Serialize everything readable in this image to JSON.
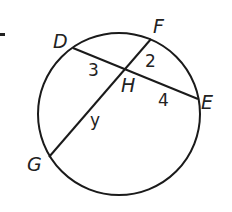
{
  "diagram": {
    "type": "circle-intersecting-chords",
    "marker": "-",
    "circle": {
      "cx": 119,
      "cy": 114,
      "r": 81,
      "stroke": "#1a1a1a"
    },
    "points": {
      "D": {
        "label": "D",
        "x": 73,
        "y": 48
      },
      "F": {
        "label": "F",
        "x": 151,
        "y": 39
      },
      "H": {
        "label": "H",
        "x": 128,
        "y": 68
      },
      "E": {
        "label": "E",
        "x": 198,
        "y": 99
      },
      "G": {
        "label": "G",
        "x": 49,
        "y": 157
      }
    },
    "chords": [
      {
        "from": "D",
        "to": "E"
      },
      {
        "from": "F",
        "to": "G"
      }
    ],
    "segment_labels": {
      "DH": "3",
      "FH": "2",
      "HE": "4",
      "HG": "y"
    }
  }
}
